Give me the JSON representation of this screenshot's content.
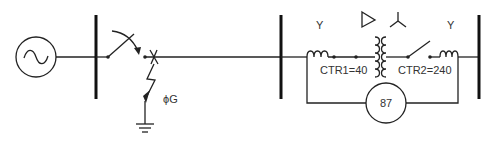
{
  "diagram": {
    "type": "single-line diagram",
    "components": {
      "generator": {
        "symbol": "sine-source"
      },
      "fault": {
        "label": "ϕG"
      },
      "ct1": {
        "label": "CTR1=40",
        "connection": "Y"
      },
      "ct2": {
        "label": "CTR2=240",
        "connection": "Y"
      },
      "transformer": {
        "primary": "delta",
        "secondary": "wye"
      },
      "relay": {
        "label": "87"
      }
    },
    "labels": {
      "ct1_conn": "Y",
      "ct2_conn": "Y",
      "ct1_ratio": "CTR1=40",
      "ct2_ratio": "CTR2=240",
      "fault": "ϕG",
      "relay": "87"
    }
  }
}
